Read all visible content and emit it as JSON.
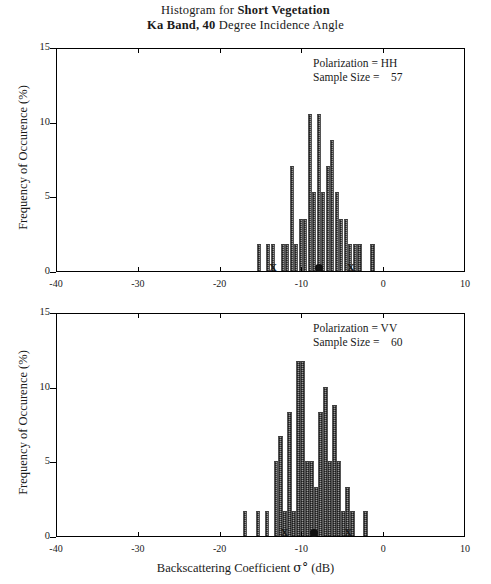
{
  "title": {
    "line1_prefix": "Histogram for ",
    "line1_bold": "Short Vegetation",
    "line2_bold": "Ka Band, 40",
    "line2_suffix": " Degree Incidence Angle"
  },
  "axis": {
    "ylabel": "Frequency of Occurence (%)",
    "xlabel_prefix": "Backscattering Coefficient  ",
    "xlabel_symbol": "σ°",
    "xlabel_suffix": " (dB)",
    "yticks": [
      0,
      5,
      10,
      15
    ],
    "xticks": [
      -40,
      -30,
      -20,
      -10,
      0,
      10
    ],
    "xlim": [
      -40,
      10
    ],
    "ylim": [
      0,
      15
    ]
  },
  "panels": [
    {
      "id": "hh",
      "annotation_line1": "Polarization = HH",
      "annotation_line2": "Sample Size =    57",
      "polarization": "HH",
      "sample_size": 57,
      "markers": {
        "x_low": -13.6,
        "mean_dot": -8.0,
        "x_high": -4.1
      },
      "chart_data": {
        "type": "bar",
        "title": "Histogram for Short Vegetation - Ka Band, 40 Degree Incidence Angle (HH)",
        "xlabel": "Backscattering Coefficient σ° (dB)",
        "ylabel": "Frequency of Occurence (%)",
        "xlim": [
          -40,
          10
        ],
        "ylim": [
          0,
          15
        ],
        "bin_width": 0.55,
        "grid": false,
        "legend": "none",
        "x": [
          -15.3,
          -14.2,
          -13.6,
          -12.4,
          -11.9,
          -11.3,
          -10.8,
          -10.2,
          -9.7,
          -9.1,
          -8.6,
          -8.0,
          -7.5,
          -6.9,
          -6.4,
          -5.8,
          -5.3,
          -4.7,
          -4.2,
          -3.6,
          -3.0,
          -1.4
        ],
        "values": [
          1.8,
          1.8,
          1.8,
          1.8,
          1.8,
          7.0,
          1.8,
          3.5,
          3.5,
          10.5,
          5.3,
          10.5,
          5.3,
          7.0,
          8.8,
          5.3,
          3.5,
          3.5,
          1.8,
          1.8,
          1.8,
          1.8
        ]
      }
    },
    {
      "id": "vv",
      "annotation_line1": "Polarization = VV",
      "annotation_line2": "Sample Size =    60",
      "polarization": "VV",
      "sample_size": 60,
      "markers": {
        "x_low": -12.2,
        "mean_dot": -8.6,
        "x_high": -4.4
      },
      "chart_data": {
        "type": "bar",
        "title": "Histogram for Short Vegetation - Ka Band, 40 Degree Incidence Angle (VV)",
        "xlabel": "Backscattering Coefficient σ° (dB)",
        "ylabel": "Frequency of Occurence (%)",
        "xlim": [
          -40,
          10
        ],
        "ylim": [
          0,
          15
        ],
        "bin_width": 0.55,
        "grid": false,
        "legend": "none",
        "x": [
          -17.0,
          -15.4,
          -14.3,
          -13.2,
          -12.7,
          -12.2,
          -11.6,
          -11.1,
          -10.5,
          -10.0,
          -9.4,
          -8.9,
          -8.3,
          -7.8,
          -7.2,
          -6.7,
          -6.1,
          -5.6,
          -5.0,
          -4.5,
          -3.9,
          -2.3
        ],
        "values": [
          1.7,
          1.7,
          1.7,
          5.0,
          6.7,
          1.7,
          8.3,
          1.7,
          11.7,
          11.7,
          5.0,
          5.0,
          3.3,
          8.3,
          10.0,
          5.0,
          8.8,
          5.0,
          1.7,
          3.3,
          1.7,
          1.7
        ]
      }
    }
  ],
  "markers_legend": {
    "x_symbol": "X",
    "dot_name": "mean-marker"
  }
}
